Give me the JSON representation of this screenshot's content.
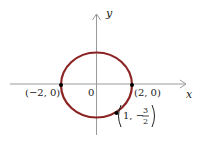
{
  "diagram": {
    "type": "ellipse-on-axes",
    "equation_hint": "x^2/4 + y^2/3 = 1",
    "axes": {
      "x_label": "x",
      "y_label": "y",
      "origin_label": "0"
    },
    "curve_color": "#8b2323",
    "axis_color": "#9a9a9a",
    "points": [
      {
        "label": "(−2, 0)",
        "x": -2,
        "y": 0
      },
      {
        "label": "(2, 0)",
        "x": 2,
        "y": 0
      },
      {
        "label_prefix": "1, −",
        "frac_num": "3",
        "frac_den": "2",
        "x": 1,
        "y": -1.5
      }
    ]
  }
}
